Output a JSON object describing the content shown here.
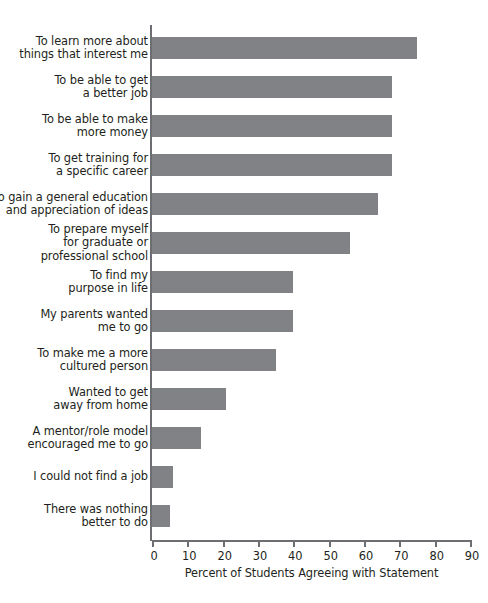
{
  "chart_data": {
    "type": "bar",
    "orientation": "horizontal",
    "title": "",
    "xlabel": "Percent of Students Agreeing with Statement",
    "ylabel": "",
    "xlim": [
      0,
      90
    ],
    "xticks": [
      0,
      10,
      20,
      30,
      40,
      50,
      60,
      70,
      80,
      90
    ],
    "grid": false,
    "legend": null,
    "bar_color": "#808285",
    "axis_color": "#6d6e71",
    "text_color": "#231f20",
    "categories": [
      "To learn more about\nthings that interest me",
      "To be able to get\na better job",
      "To be able to make\nmore money",
      "To get training for\na specific career",
      "To gain a general education\nand appreciation of ideas",
      "To prepare myself\nfor graduate or\nprofessional school",
      "To find my\npurpose in life",
      "My parents wanted\nme to go",
      "To make me a more\ncultured person",
      "Wanted to get\naway from home",
      "A mentor/role model\nencouraged me to go",
      "I could not find a job",
      "There was nothing\nbetter to do"
    ],
    "values": [
      75,
      68,
      68,
      68,
      64,
      56,
      40,
      40,
      35,
      21,
      14,
      6,
      5
    ]
  }
}
